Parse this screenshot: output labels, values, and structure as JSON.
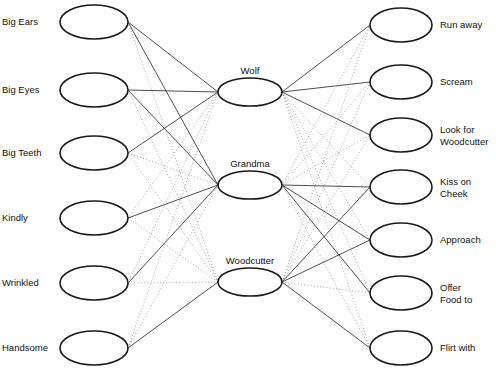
{
  "diagram": {
    "background_color": "#ffffff",
    "node_stroke_color": "#1a1a1a",
    "edge_solid_color": "#3a3a3a",
    "edge_dotted_color": "#9a9a9a"
  },
  "layers": {
    "input": {
      "name": "Features",
      "nodes": [
        {
          "label": "Big Ears",
          "cx": 94,
          "cy": 22,
          "rx": 34,
          "ry": 17
        },
        {
          "label": "Big Eyes",
          "cx": 94,
          "cy": 90,
          "rx": 34,
          "ry": 17
        },
        {
          "label": "Big Teeth",
          "cx": 94,
          "cy": 153,
          "rx": 34,
          "ry": 17
        },
        {
          "label": "Kindly",
          "cx": 94,
          "cy": 218,
          "rx": 34,
          "ry": 17
        },
        {
          "label": "Wrinkled",
          "cx": 94,
          "cy": 283,
          "rx": 34,
          "ry": 17
        },
        {
          "label": "Handsome",
          "cx": 94,
          "cy": 348,
          "rx": 34,
          "ry": 17
        }
      ]
    },
    "hidden": {
      "name": "Characters",
      "nodes": [
        {
          "label": "Wolf",
          "cx": 250,
          "cy": 92,
          "rx": 32,
          "ry": 14
        },
        {
          "label": "Grandma",
          "cx": 250,
          "cy": 185,
          "rx": 32,
          "ry": 14
        },
        {
          "label": "Woodcutter",
          "cx": 250,
          "cy": 282,
          "rx": 32,
          "ry": 14
        }
      ]
    },
    "output": {
      "name": "Actions",
      "nodes": [
        {
          "label": "Run away",
          "cx": 401,
          "cy": 25,
          "rx": 31,
          "ry": 17
        },
        {
          "label": "Scream",
          "cx": 401,
          "cy": 82,
          "rx": 31,
          "ry": 17
        },
        {
          "label": "Look for\nWoodcutter",
          "cx": 401,
          "cy": 135,
          "rx": 31,
          "ry": 17
        },
        {
          "label": "Kiss on\nCheek",
          "cx": 401,
          "cy": 187,
          "rx": 31,
          "ry": 17
        },
        {
          "label": "Approach",
          "cx": 401,
          "cy": 240,
          "rx": 31,
          "ry": 17
        },
        {
          "label": "Offer\nFood to",
          "cx": 401,
          "cy": 293,
          "rx": 31,
          "ry": 17
        },
        {
          "label": "Flirt with",
          "cx": 401,
          "cy": 348,
          "rx": 31,
          "ry": 17
        }
      ]
    }
  },
  "edges": {
    "input_to_hidden": [
      {
        "from": 0,
        "to": 0,
        "style": "solid"
      },
      {
        "from": 0,
        "to": 1,
        "style": "solid"
      },
      {
        "from": 0,
        "to": 2,
        "style": "dotted"
      },
      {
        "from": 1,
        "to": 0,
        "style": "solid"
      },
      {
        "from": 1,
        "to": 1,
        "style": "solid"
      },
      {
        "from": 1,
        "to": 2,
        "style": "dotted"
      },
      {
        "from": 2,
        "to": 0,
        "style": "solid"
      },
      {
        "from": 2,
        "to": 1,
        "style": "dotted"
      },
      {
        "from": 2,
        "to": 2,
        "style": "dotted"
      },
      {
        "from": 3,
        "to": 0,
        "style": "dotted"
      },
      {
        "from": 3,
        "to": 1,
        "style": "solid"
      },
      {
        "from": 3,
        "to": 2,
        "style": "dotted"
      },
      {
        "from": 4,
        "to": 0,
        "style": "dotted"
      },
      {
        "from": 4,
        "to": 1,
        "style": "solid"
      },
      {
        "from": 4,
        "to": 2,
        "style": "dotted"
      },
      {
        "from": 5,
        "to": 0,
        "style": "dotted"
      },
      {
        "from": 5,
        "to": 1,
        "style": "dotted"
      },
      {
        "from": 5,
        "to": 2,
        "style": "solid"
      }
    ],
    "hidden_to_output": [
      {
        "from": 0,
        "to": 0,
        "style": "solid"
      },
      {
        "from": 0,
        "to": 1,
        "style": "solid"
      },
      {
        "from": 0,
        "to": 2,
        "style": "solid"
      },
      {
        "from": 0,
        "to": 3,
        "style": "dotted"
      },
      {
        "from": 0,
        "to": 4,
        "style": "dotted"
      },
      {
        "from": 0,
        "to": 5,
        "style": "dotted"
      },
      {
        "from": 0,
        "to": 6,
        "style": "dotted"
      },
      {
        "from": 1,
        "to": 0,
        "style": "dotted"
      },
      {
        "from": 1,
        "to": 1,
        "style": "dotted"
      },
      {
        "from": 1,
        "to": 2,
        "style": "dotted"
      },
      {
        "from": 1,
        "to": 3,
        "style": "solid"
      },
      {
        "from": 1,
        "to": 4,
        "style": "solid"
      },
      {
        "from": 1,
        "to": 5,
        "style": "solid"
      },
      {
        "from": 1,
        "to": 6,
        "style": "dotted"
      },
      {
        "from": 2,
        "to": 0,
        "style": "dotted"
      },
      {
        "from": 2,
        "to": 1,
        "style": "dotted"
      },
      {
        "from": 2,
        "to": 2,
        "style": "dotted"
      },
      {
        "from": 2,
        "to": 3,
        "style": "solid"
      },
      {
        "from": 2,
        "to": 4,
        "style": "solid"
      },
      {
        "from": 2,
        "to": 5,
        "style": "dotted"
      },
      {
        "from": 2,
        "to": 6,
        "style": "solid"
      }
    ]
  }
}
